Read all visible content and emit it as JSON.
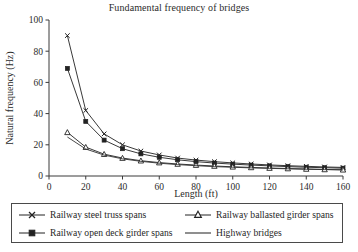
{
  "chart_data": {
    "type": "line",
    "title": "Fundamental frequency of bridges",
    "xlabel": "Length (ft)",
    "ylabel": "Natural frequency (Hz)",
    "xlim": [
      0,
      160
    ],
    "ylim": [
      0,
      100
    ],
    "xticks": [
      0,
      20,
      40,
      60,
      80,
      100,
      120,
      140,
      160
    ],
    "yticks": [
      0,
      20,
      40,
      60,
      80,
      100
    ],
    "grid": false,
    "legend_position": "below-plot",
    "x": [
      10,
      20,
      30,
      40,
      50,
      60,
      70,
      80,
      90,
      100,
      110,
      120,
      130,
      140,
      150,
      160
    ],
    "series": [
      {
        "name": "Railway steel truss spans",
        "marker": "x-marker",
        "color": "#222222",
        "values": [
          90,
          42,
          27,
          20,
          16,
          13.5,
          11.5,
          10.2,
          9.2,
          8.4,
          7.7,
          7.1,
          6.6,
          6.2,
          5.8,
          5.5
        ]
      },
      {
        "name": "Railway open deck girder spans",
        "marker": "square-marker",
        "color": "#222222",
        "values": [
          69,
          35,
          23,
          17.5,
          14.2,
          12,
          10.4,
          9.2,
          8.3,
          7.6,
          7.0,
          6.5,
          6.0,
          5.6,
          5.3,
          5.0
        ]
      },
      {
        "name": "Railway ballasted girder spans",
        "marker": "triangle-marker",
        "color": "#222222",
        "values": [
          28,
          18.5,
          14,
          11.5,
          9.8,
          8.6,
          7.7,
          7.0,
          6.4,
          5.9,
          5.5,
          5.1,
          4.8,
          4.5,
          4.2,
          4.0
        ]
      },
      {
        "name": "Highway bridges",
        "marker": "none",
        "color": "#333333",
        "values": [
          25,
          17.3,
          13.4,
          11.0,
          9.4,
          8.2,
          7.3,
          6.6,
          6.0,
          5.6,
          5.2,
          4.9,
          4.6,
          4.3,
          4.1,
          3.9
        ]
      }
    ]
  },
  "legend": {
    "entries": [
      {
        "label": "Railway steel truss spans",
        "marker": "x-marker"
      },
      {
        "label": "Railway ballasted girder spans",
        "marker": "triangle-marker"
      },
      {
        "label": "Railway open deck girder spans",
        "marker": "square-marker"
      },
      {
        "label": "Highway bridges",
        "marker": "none"
      }
    ]
  }
}
